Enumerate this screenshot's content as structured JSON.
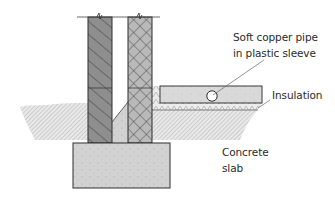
{
  "diagram": {
    "type": "cross-section",
    "labels": {
      "pipe_line1": "Soft copper pipe",
      "pipe_line2": "in plastic sleeve",
      "insulation": "Insulation",
      "slab_line1": "Concrete",
      "slab_line2": "slab"
    },
    "components": [
      {
        "id": "outer-wall",
        "pattern": "diagonal-hatch",
        "color": "#8a8a8a"
      },
      {
        "id": "cavity",
        "pattern": "empty / partial fill",
        "color": "#ffffff"
      },
      {
        "id": "inner-wall",
        "pattern": "crosshatch",
        "color": "#b5b5b5"
      },
      {
        "id": "footing",
        "pattern": "stipple",
        "color": "#cfcfcf"
      },
      {
        "id": "floor-slab",
        "pattern": "stipple",
        "color": "#d4d4d4"
      },
      {
        "id": "insulation-layer",
        "pattern": "zigzag",
        "color": "#e2e2e2"
      },
      {
        "id": "pipe",
        "shape": "circle",
        "color": "#ffffff"
      },
      {
        "id": "ground",
        "pattern": "fine diagonal hatch",
        "color": "#c8c8c8"
      }
    ],
    "colors": {
      "outline": "#3a3a3a",
      "dark_wall": "#8c8c8c",
      "light_wall": "#b8b8b8",
      "concrete": "#d0d0d0",
      "ground": "#bdbdbd"
    }
  }
}
